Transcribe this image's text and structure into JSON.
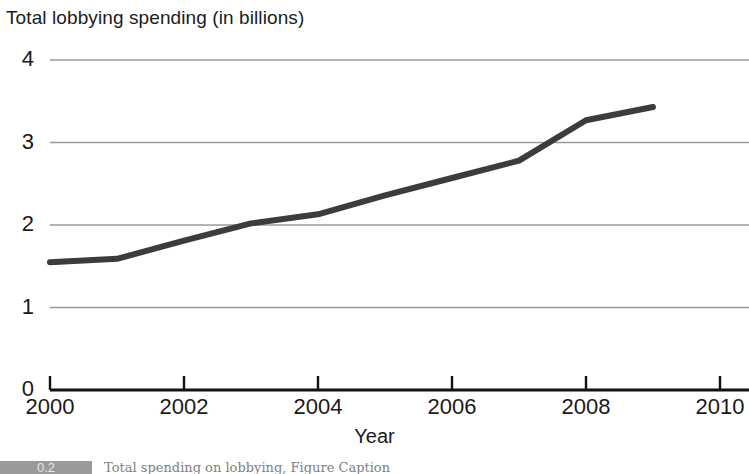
{
  "chart_data": {
    "type": "line",
    "title": "Total lobbying spending (in billions)",
    "xlabel": "Year",
    "ylabel": "",
    "x": [
      2000,
      2001,
      2002,
      2003,
      2004,
      2005,
      2006,
      2007,
      2008,
      2009
    ],
    "values": [
      1.55,
      1.59,
      1.81,
      2.02,
      2.13,
      2.36,
      2.57,
      2.78,
      3.27,
      3.43
    ],
    "series": [
      {
        "name": "Total lobbying spending",
        "values": [
          1.55,
          1.59,
          1.81,
          2.02,
          2.13,
          2.36,
          2.57,
          2.78,
          3.27,
          3.43
        ]
      }
    ],
    "xlim": [
      2000,
      2010
    ],
    "ylim": [
      0,
      4
    ],
    "xticks": [
      2000,
      2002,
      2004,
      2006,
      2008,
      2010
    ],
    "xtick_labels": [
      "2000",
      "2002",
      "2004",
      "2006",
      "2008",
      "2010"
    ],
    "yticks": [
      0,
      1,
      2,
      3,
      4
    ],
    "ytick_labels": [
      "0",
      "1",
      "2",
      "3",
      "4"
    ],
    "grid": "horizontal",
    "legend": "none",
    "line_color": "#3c3c3c",
    "grid_color": "#9a9a9a",
    "axis_color": "#111111"
  },
  "caption": {
    "badge": "0.2",
    "text": "Total spending on lobbying, Figure Caption"
  }
}
